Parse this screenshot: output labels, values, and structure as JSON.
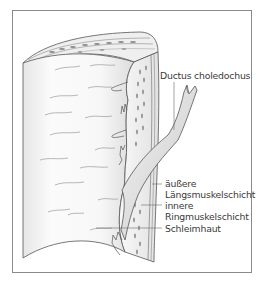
{
  "figure": {
    "labels": [
      {
        "id": "ductus",
        "text": "Ductus choledochus"
      },
      {
        "id": "aeussere",
        "line1": "äußere",
        "line2": "Längsmuskelschicht"
      },
      {
        "id": "innere",
        "line1": "innere",
        "line2": "Ringmuskelschicht"
      },
      {
        "id": "schleimhaut",
        "text": "Schleimhaut"
      }
    ],
    "colors": {
      "frame": "#8a8a8a",
      "outline": "#555555",
      "shade": "#d9d9d9",
      "label_text": "#3a3a3a",
      "leader_line": "#6a6a6a"
    }
  }
}
